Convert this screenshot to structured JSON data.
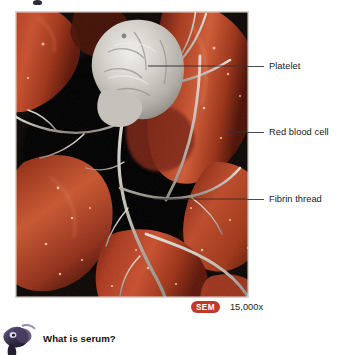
{
  "figure": {
    "image_alt": "Scanning electron micrograph of a blood clot showing a platelet with fibrin threads among red blood cells",
    "background_color": "#0a0604",
    "red_blood_cell_color": "#b8381f",
    "fibrin_color": "#c9c4bd",
    "platelet_color": "#d9d7d2"
  },
  "callouts": [
    {
      "label": "Platelet",
      "icon": "leader-line"
    },
    {
      "label": "Red blood cell",
      "icon": "leader-line"
    },
    {
      "label": "Fibrin thread",
      "icon": "leader-line"
    }
  ],
  "magnification": {
    "badge": "SEM",
    "badge_color": "#c0392b",
    "value": "15,000x"
  },
  "question": {
    "icon": "magnifier-mascot-icon",
    "text": "What is serum?"
  }
}
